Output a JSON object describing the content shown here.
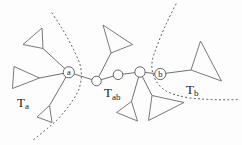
{
  "figure": {
    "background_color": "#fdfdfd",
    "line_color": "#606060",
    "dash_color": "#4a4a4a",
    "text_color": "#1c1c1c",
    "named_nodes": {
      "a": {
        "label": "a"
      },
      "b": {
        "label": "b"
      }
    },
    "plain_node_count": 3,
    "triangle_count": 7,
    "separator_count": 2,
    "region_labels": {
      "ta": {
        "base": "T",
        "sub": "a"
      },
      "tab": {
        "base": "T",
        "sub": "ab"
      },
      "tb": {
        "base": "T",
        "sub": "b"
      }
    }
  }
}
